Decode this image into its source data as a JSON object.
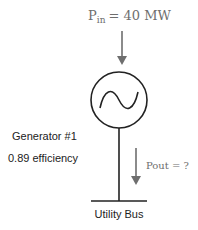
{
  "input_power": {
    "symbol": "P",
    "subscript": "in",
    "value_text": "= 40 MW"
  },
  "generator": {
    "name": "Generator #1",
    "efficiency_text": "0.89 efficiency",
    "symbol": "ac-sine-source"
  },
  "output_power": {
    "label": "Pout = ?"
  },
  "bus": {
    "label": "Utility Bus"
  },
  "colors": {
    "line": "#222222",
    "arrow": "#6e6e6e",
    "serif_text": "#6e6e6e"
  }
}
